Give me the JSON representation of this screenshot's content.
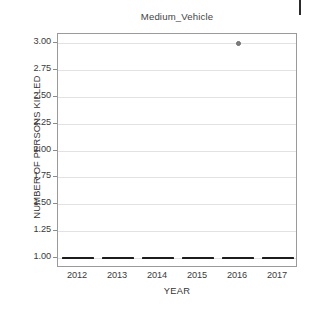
{
  "chart_data": {
    "type": "scatter",
    "title": "Medium_Vehicle",
    "xlabel": "YEAR",
    "ylabel": "NUMBER OF PERSONS KILLED",
    "categories": [
      "2012",
      "2013",
      "2014",
      "2015",
      "2016",
      "2017"
    ],
    "ytick_labels": [
      "3.00",
      "2.75",
      "2.50",
      "2.25",
      "2.00",
      "1.75",
      "1.50",
      "1.25",
      "1.00"
    ],
    "ytick_values": [
      3.0,
      2.75,
      2.5,
      2.25,
      2.0,
      1.75,
      1.5,
      1.25,
      1.0
    ],
    "ylim": [
      1.0,
      3.0
    ],
    "grid": true,
    "legend": "none",
    "series": [
      {
        "name": "median",
        "mark": "horizontal-bar",
        "values": [
          1.0,
          1.0,
          1.0,
          1.0,
          1.0,
          1.0
        ],
        "color": "#1c1c1c"
      },
      {
        "name": "outlier",
        "mark": "point",
        "points": [
          {
            "x": "2016",
            "y": 3.0
          }
        ],
        "color": "#7d7d7d"
      }
    ],
    "colors": {
      "median_bar": "#1c1c1c",
      "outlier": "#7d7d7d",
      "gridline": "#e2e2e2",
      "frame": "#9a9a9a",
      "background": "#ffffff",
      "text": "#3a3a3a"
    }
  }
}
